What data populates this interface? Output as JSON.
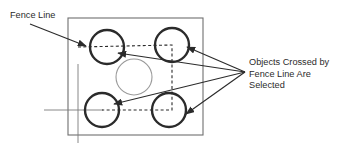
{
  "diagram": {
    "type": "technical-illustration",
    "background_color": "#ffffff",
    "stroke_color": "#3a3a3a",
    "selected_stroke_color": "#2b2b2b",
    "unselected_stroke_color": "#8a8a8a",
    "dashed_color": "#3a3a3a",
    "labels": {
      "fence_line": "Fence Line",
      "objects_line1": "Objects Crossed by",
      "objects_line2": "Fence Line Are",
      "objects_line3": "Selected"
    },
    "boundary": {
      "name": "drawing-boundary-rectangle",
      "x": 68,
      "y": 18,
      "width": 135,
      "height": 117
    },
    "circles": [
      {
        "id": "circle-top-left",
        "cx": 107,
        "cy": 47,
        "r": 17,
        "selected": true
      },
      {
        "id": "circle-top-right",
        "cx": 172,
        "cy": 45,
        "r": 17,
        "selected": true
      },
      {
        "id": "circle-center",
        "cx": 134,
        "cy": 77,
        "r": 18,
        "selected": false
      },
      {
        "id": "circle-bottom-left",
        "cx": 102,
        "cy": 110,
        "r": 17,
        "selected": true
      },
      {
        "id": "circle-bottom-right",
        "cx": 169,
        "cy": 110,
        "r": 17,
        "selected": true
      }
    ],
    "fence_path": {
      "name": "fence-line-path",
      "points": "78,47 172,45 172,110 102,110",
      "style": "dashed"
    },
    "crosshair": {
      "vertical_x": 78,
      "vertical_y1": 64,
      "vertical_y2": 143,
      "horizontal_y": 110,
      "horizontal_x1": 44,
      "horizontal_x2": 103
    },
    "fence_label_arrow": {
      "from_x": 30,
      "from_y": 24,
      "to_x": 86,
      "to_y": 46
    },
    "callout_origin": {
      "x": 245,
      "y": 72
    },
    "callout_arrows": [
      {
        "name": "arrow-to-top-left-circle",
        "to_x": 118,
        "to_y": 53
      },
      {
        "name": "arrow-to-top-right-circle",
        "to_x": 187,
        "to_y": 47
      },
      {
        "name": "arrow-to-bottom-left-circle",
        "to_x": 114,
        "to_y": 104
      },
      {
        "name": "arrow-to-bottom-right-circle",
        "to_x": 186,
        "to_y": 114
      }
    ],
    "text_block_position": {
      "x": 249,
      "y": 65,
      "line_height": 11.5
    }
  }
}
